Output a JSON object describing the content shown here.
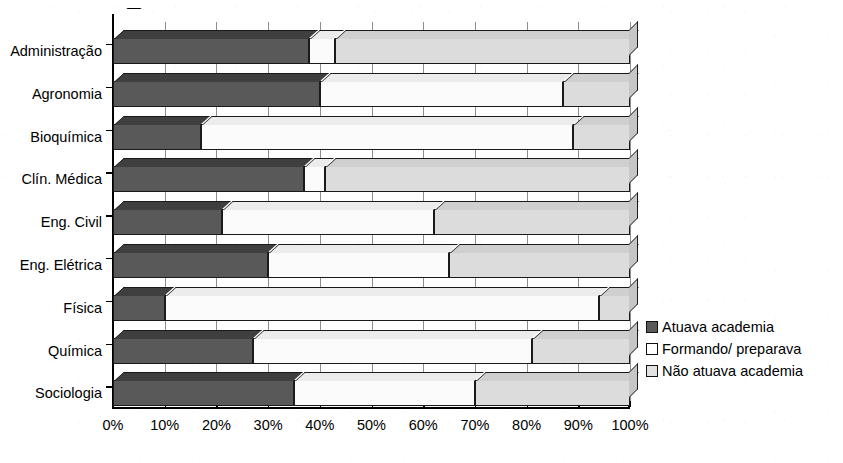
{
  "chart_data": {
    "type": "bar",
    "orientation": "horizontal",
    "stacked": true,
    "normalized_percent": true,
    "title": "",
    "xlabel": "",
    "ylabel": "",
    "xlim": [
      0,
      100
    ],
    "grid": true,
    "legend_position": "right",
    "categories": [
      "Administração",
      "Agronomia",
      "Bioquímica",
      "Clín. Médica",
      "Eng. Civil",
      "Eng. Elétrica",
      "Física",
      "Química",
      "Sociologia"
    ],
    "series": [
      {
        "name": "Atuava academia",
        "color": "#595959",
        "values": [
          38,
          40,
          17,
          37,
          21,
          30,
          10,
          27,
          35
        ]
      },
      {
        "name": "Formando/ preparava",
        "color": "#fbfbfb",
        "values": [
          5,
          47,
          72,
          4,
          41,
          35,
          84,
          54,
          35
        ]
      },
      {
        "name": "Não atuava academia",
        "color": "#dcdcdc",
        "values": [
          57,
          13,
          11,
          59,
          38,
          35,
          6,
          19,
          30
        ]
      }
    ],
    "xticks": [
      0,
      10,
      20,
      30,
      40,
      50,
      60,
      70,
      80,
      90,
      100
    ],
    "xticklabels": [
      "0%",
      "10%",
      "20%",
      "30%",
      "40%",
      "50%",
      "60%",
      "70%",
      "80%",
      "90%",
      "100%"
    ]
  },
  "legend": {
    "items": [
      {
        "label": "Atuava academia",
        "swatch": "dark"
      },
      {
        "label": "Formando/ preparava",
        "swatch": "white"
      },
      {
        "label": "Não atuava academia",
        "swatch": "light"
      }
    ]
  },
  "colors": {
    "series_dark": "#595959",
    "series_white": "#fbfbfb",
    "series_light": "#dcdcdc",
    "axis": "#000000",
    "grid": "#8e8e8e",
    "background": "#ffffff"
  }
}
